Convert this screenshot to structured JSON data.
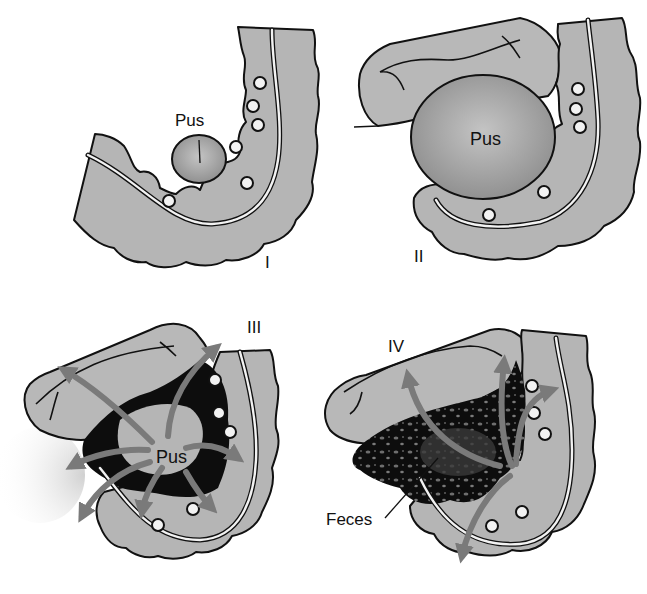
{
  "figure": {
    "colors": {
      "bowel": "#b5b5b5",
      "outline": "#111111",
      "diverticulum": "#f2f2f2",
      "pus": "#8f8f8f",
      "arrow": "#7a7a7a",
      "contamination": "#0d0d0d",
      "background": "#ffffff"
    },
    "panels": [
      {
        "stage": "I",
        "labels": {
          "pus": "Pus"
        },
        "description": "Small pericolic abscess"
      },
      {
        "stage": "II",
        "labels": {
          "pus": "Pus"
        },
        "description": "Large pelvic abscess"
      },
      {
        "stage": "III",
        "labels": {
          "pus": "Pus"
        },
        "description": "Purulent peritonitis"
      },
      {
        "stage": "IV",
        "labels": {
          "feces": "Feces"
        },
        "description": "Fecal peritonitis"
      }
    ]
  }
}
